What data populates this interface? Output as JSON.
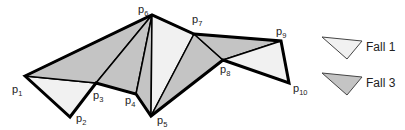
{
  "diagram": {
    "colors": {
      "case1_fill": "#f1f1f1",
      "case3_fill": "#c4c4c4",
      "stroke": "#000000",
      "background": "#ffffff"
    },
    "points": [
      {
        "id": "p1",
        "base": "p",
        "sub": "1",
        "x": 25,
        "y": 76
      },
      {
        "id": "p2",
        "base": "p",
        "sub": "2",
        "x": 70,
        "y": 117
      },
      {
        "id": "p3",
        "base": "p",
        "sub": "3",
        "x": 96,
        "y": 83
      },
      {
        "id": "p4",
        "base": "p",
        "sub": "4",
        "x": 136,
        "y": 94
      },
      {
        "id": "p5",
        "base": "p",
        "sub": "5",
        "x": 151,
        "y": 116
      },
      {
        "id": "p6",
        "base": "p",
        "sub": "6",
        "x": 152,
        "y": 15
      },
      {
        "id": "p7",
        "base": "p",
        "sub": "7",
        "x": 194,
        "y": 34
      },
      {
        "id": "p8",
        "base": "p",
        "sub": "8",
        "x": 223,
        "y": 60
      },
      {
        "id": "p9",
        "base": "p",
        "sub": "9",
        "x": 281,
        "y": 41
      },
      {
        "id": "p10",
        "base": "p",
        "sub": "10",
        "x": 289,
        "y": 83
      }
    ],
    "triangles": [
      {
        "verts": [
          "p1",
          "p2",
          "p3"
        ],
        "case": "Fall 1"
      },
      {
        "verts": [
          "p1",
          "p3",
          "p6"
        ],
        "case": "Fall 3"
      },
      {
        "verts": [
          "p3",
          "p4",
          "p6"
        ],
        "case": "Fall 3"
      },
      {
        "verts": [
          "p4",
          "p5",
          "p6"
        ],
        "case": "Fall 3"
      },
      {
        "verts": [
          "p5",
          "p6",
          "p7"
        ],
        "case": "Fall 1"
      },
      {
        "verts": [
          "p5",
          "p7",
          "p8"
        ],
        "case": "Fall 3"
      },
      {
        "verts": [
          "p7",
          "p8",
          "p9"
        ],
        "case": "Fall 3"
      },
      {
        "verts": [
          "p8",
          "p9",
          "p10"
        ],
        "case": "Fall 1"
      }
    ],
    "legend": [
      {
        "label": "Fall 1",
        "case": "case1"
      },
      {
        "label": "Fall 3",
        "case": "case3"
      }
    ]
  }
}
